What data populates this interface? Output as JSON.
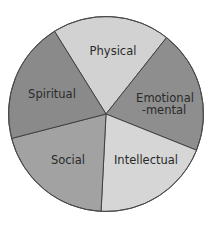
{
  "chart_data": {
    "type": "pie",
    "title": "",
    "categories": [
      "Physical",
      "Emotional-mental",
      "Intellectual",
      "Social",
      "Spiritual"
    ],
    "values": [
      20,
      20,
      20,
      20,
      20
    ],
    "measured_degrees": [
      70.3,
      73.4,
      71.1,
      72.6,
      72.6
    ],
    "colors": [
      "#d2d2d2",
      "#8e8e8e",
      "#d6d6d6",
      "#a2a2a2",
      "#8a8a8a"
    ],
    "legend": "none (labels drawn inside slices)",
    "start_angle_deg": 238.1,
    "direction": "clockwise"
  },
  "labels": {
    "physical": "Physical",
    "emotional_line1": "Emotional",
    "emotional_line2": "-mental",
    "intellectual": "Intellectual",
    "social": "Social",
    "spiritual": "Spiritual"
  }
}
